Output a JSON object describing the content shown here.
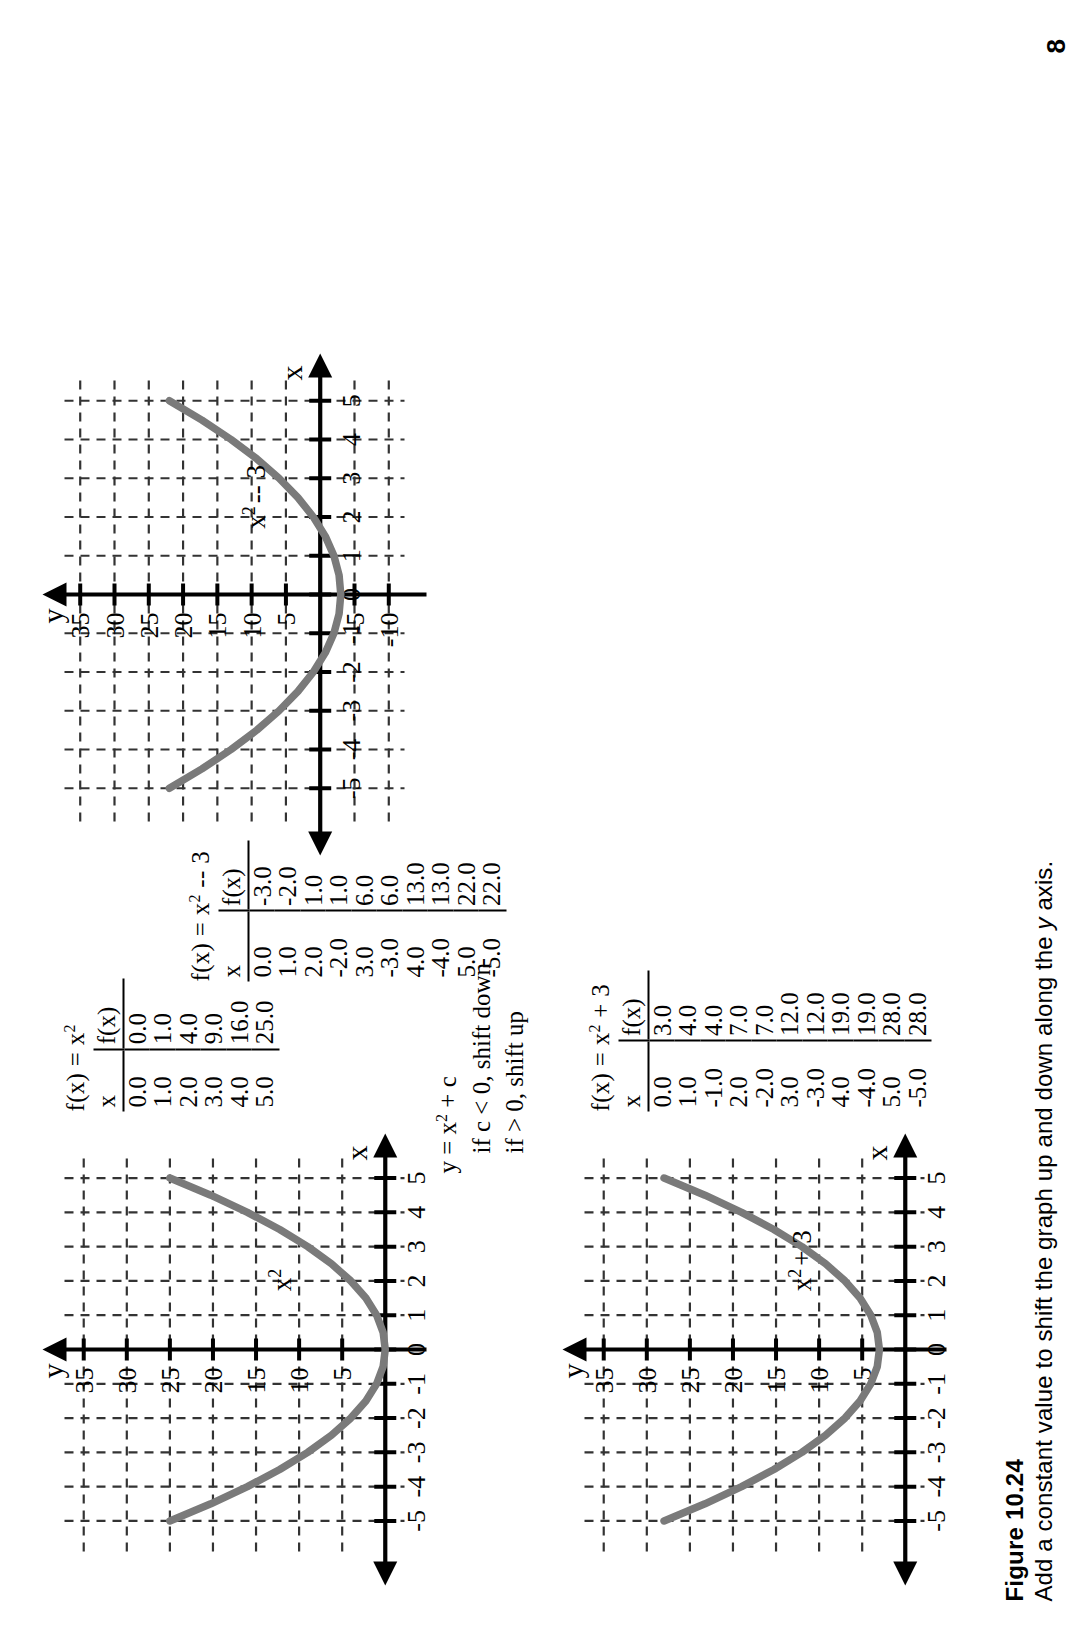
{
  "figure": {
    "number": "Figure 10.24",
    "caption_before": "Add a constant value to shift the graph up and down along the ",
    "caption_italic": "y",
    "caption_after": " axis.",
    "page_number": "8"
  },
  "note": {
    "line1": "y = x",
    "line1_sup": "2",
    "line1_tail": " + c",
    "line2": "if c < 0, shift down",
    "line3": "if > 0, shift up"
  },
  "tables": [
    {
      "id": "table-x-squared",
      "title_prefix": "f(x) = x",
      "title_sup": "2",
      "title_suffix": "",
      "headers": [
        "x",
        "f(x)"
      ],
      "rows": [
        [
          "0.0",
          "0.0"
        ],
        [
          "1.0",
          "1.0"
        ],
        [
          "2.0",
          "4.0"
        ],
        [
          "3.0",
          "9.0"
        ],
        [
          "4.0",
          "16.0"
        ],
        [
          "5.0",
          "25.0"
        ]
      ]
    },
    {
      "id": "table-x-squared-plus-3",
      "title_prefix": "f(x) = x",
      "title_sup": "2",
      "title_suffix": " + 3",
      "headers": [
        "x",
        "f(x)"
      ],
      "rows": [
        [
          "0.0",
          "3.0"
        ],
        [
          "1.0",
          "4.0"
        ],
        [
          "-1.0",
          "4.0"
        ],
        [
          "2.0",
          "7.0"
        ],
        [
          "-2.0",
          "7.0"
        ],
        [
          "3.0",
          "12.0"
        ],
        [
          "-3.0",
          "12.0"
        ],
        [
          "4.0",
          "19.0"
        ],
        [
          "-4.0",
          "19.0"
        ],
        [
          "5.0",
          "28.0"
        ],
        [
          "-5.0",
          "28.0"
        ]
      ]
    },
    {
      "id": "table-x-squared-minus-3",
      "title_prefix": "f(x) = x",
      "title_sup": "2",
      "title_suffix": " -- 3",
      "headers": [
        "x",
        "f(x)"
      ],
      "rows": [
        [
          "0.0",
          "-3.0"
        ],
        [
          "1.0",
          "-2.0"
        ],
        [
          "2.0",
          "1.0"
        ],
        [
          "-2.0",
          "1.0"
        ],
        [
          "3.0",
          "6.0"
        ],
        [
          "-3.0",
          "6.0"
        ],
        [
          "4.0",
          "13.0"
        ],
        [
          "-4.0",
          "13.0"
        ],
        [
          "5.0",
          "22.0"
        ],
        [
          "-5.0",
          "22.0"
        ]
      ]
    }
  ],
  "chart_data": [
    {
      "id": "graph-x-squared",
      "type": "line",
      "title": "",
      "curve_label": "x2",
      "curve_label_prefix": "x",
      "curve_label_sup": "2",
      "xlabel": "x",
      "ylabel": "y",
      "xlim": [
        -5.6,
        5.6
      ],
      "ylim": [
        -2,
        37
      ],
      "xticks": [
        -5,
        -4,
        -3,
        -2,
        -1,
        0,
        1,
        2,
        3,
        4,
        5
      ],
      "xticklabels": [
        "-5",
        "-4",
        "-3",
        "-2",
        "-1",
        "0",
        "1",
        "2",
        "3",
        "4",
        "5"
      ],
      "yticks": [
        5,
        10,
        15,
        20,
        25,
        30,
        35
      ],
      "yticklabels": [
        "5",
        "10",
        "15",
        "20",
        "25",
        "30",
        "35"
      ],
      "grid": true,
      "x": [
        -5,
        -4.5,
        -4,
        -3.5,
        -3,
        -2.5,
        -2,
        -1.5,
        -1,
        -0.5,
        0,
        0.5,
        1,
        1.5,
        2,
        2.5,
        3,
        3.5,
        4,
        4.5,
        5
      ],
      "y": [
        25,
        20.25,
        16,
        12.25,
        9,
        6.25,
        4,
        2.25,
        1,
        0.25,
        0,
        0.25,
        1,
        2.25,
        4,
        6.25,
        9,
        12.25,
        16,
        20.25,
        25
      ],
      "curve_color": "#7a7a7a",
      "grid_color": "#333333"
    },
    {
      "id": "graph-x-squared-plus-3",
      "type": "line",
      "title": "",
      "curve_label": "x2+3",
      "curve_label_prefix": "x",
      "curve_label_sup": "2",
      "curve_label_tail": "+ 3",
      "xlabel": "x",
      "ylabel": "y",
      "xlim": [
        -5.6,
        5.6
      ],
      "ylim": [
        -2,
        37
      ],
      "xticks": [
        -5,
        -4,
        -3,
        -2,
        -1,
        0,
        1,
        2,
        3,
        4,
        5
      ],
      "xticklabels": [
        "-5",
        "-4",
        "-3",
        "-2",
        "-1",
        "0",
        "1",
        "2",
        "3",
        "4",
        "5"
      ],
      "yticks": [
        5,
        10,
        15,
        20,
        25,
        30,
        35
      ],
      "yticklabels": [
        "5",
        "10",
        "15",
        "20",
        "25",
        "30",
        "35"
      ],
      "grid": true,
      "x": [
        -5,
        -4.5,
        -4,
        -3.5,
        -3,
        -2.5,
        -2,
        -1.5,
        -1,
        -0.5,
        0,
        0.5,
        1,
        1.5,
        2,
        2.5,
        3,
        3.5,
        4,
        4.5,
        5
      ],
      "y": [
        28,
        23.25,
        19,
        15.25,
        12,
        9.25,
        7,
        5.25,
        4,
        3.25,
        3,
        3.25,
        4,
        5.25,
        7,
        9.25,
        12,
        15.25,
        19,
        23.25,
        28
      ],
      "curve_color": "#7a7a7a",
      "grid_color": "#333333"
    },
    {
      "id": "graph-x-squared-minus-3",
      "type": "line",
      "title": "",
      "curve_label": "x2-3",
      "curve_label_prefix": "x",
      "curve_label_sup": "2",
      "curve_label_tail": "-- 3",
      "xlabel": "x",
      "ylabel": "y",
      "xlim": [
        -5.6,
        5.6
      ],
      "ylim": [
        -12,
        37
      ],
      "xticks": [
        -5,
        -4,
        -3,
        -2,
        -1,
        0,
        1,
        2,
        3,
        4,
        5
      ],
      "xticklabels": [
        "-5",
        "-4",
        "-3",
        "-2",
        "-1",
        "0",
        "1",
        "2",
        "3",
        "4",
        "5"
      ],
      "yticks": [
        -10,
        -5,
        5,
        10,
        15,
        20,
        25,
        30,
        35
      ],
      "yticklabels": [
        "-10",
        "-5",
        "5",
        "10",
        "15",
        "20",
        "25",
        "30",
        "35"
      ],
      "grid": true,
      "x": [
        -5,
        -4.5,
        -4,
        -3.5,
        -3,
        -2.5,
        -2,
        -1.5,
        -1,
        -0.5,
        0,
        0.5,
        1,
        1.5,
        2,
        2.5,
        3,
        3.5,
        4,
        4.5,
        5
      ],
      "y": [
        22,
        17.25,
        13,
        9.25,
        6,
        3.25,
        1,
        -0.75,
        -2,
        -2.75,
        -3,
        -2.75,
        -2,
        -0.75,
        1,
        3.25,
        6,
        9.25,
        13,
        17.25,
        22
      ],
      "curve_color": "#7a7a7a",
      "grid_color": "#333333"
    }
  ]
}
